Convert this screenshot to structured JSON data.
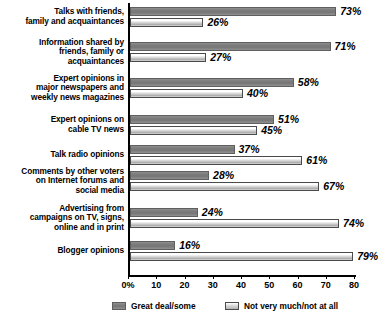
{
  "chart_data": {
    "type": "bar",
    "orientation": "horizontal",
    "title": "",
    "xlabel": "",
    "ylabel": "",
    "xlim": [
      0,
      80
    ],
    "grid": false,
    "legend_position": "bottom",
    "tick_labels": [
      "0%",
      "10",
      "20",
      "30",
      "40",
      "50",
      "60",
      "70",
      "80"
    ],
    "tick_values": [
      0,
      10,
      20,
      30,
      40,
      50,
      60,
      70,
      80
    ],
    "categories": [
      "Talks with friends, family and acquaintances",
      "Information shared by friends, family or acquaintances",
      "Expert opinions in major newspapers and weekly news magazines",
      "Expert opinions on cable TV news",
      "Talk radio opinions",
      "Comments by other voters on Internet forums and social media",
      "Advertising from campaigns on TV, signs, online and in print",
      "Blogger opinions"
    ],
    "category_lines": [
      [
        "Talks with friends,",
        "family and acquaintances"
      ],
      [
        "Information shared by",
        "friends, family or",
        "acquaintances"
      ],
      [
        "Expert opinions in",
        "major newspapers and",
        "weekly news magazines"
      ],
      [
        "Expert opinions on",
        "cable TV news"
      ],
      [
        "Talk radio opinions"
      ],
      [
        "Comments by other voters",
        "on Internet forums and",
        "social media"
      ],
      [
        "Advertising from",
        "campaigns on TV, signs,",
        "online and in print"
      ],
      [
        "Blogger opinions"
      ]
    ],
    "series": [
      {
        "name": "Great deal/some",
        "color": "#7c7c7c",
        "values": [
          73,
          71,
          58,
          51,
          37,
          28,
          24,
          16
        ],
        "labels": [
          "73%",
          "71%",
          "58%",
          "51%",
          "37%",
          "28%",
          "24%",
          "16%"
        ]
      },
      {
        "name": "Not very much/not at all",
        "color": "#ffffff",
        "values": [
          26,
          27,
          40,
          45,
          61,
          67,
          74,
          79
        ],
        "labels": [
          "26%",
          "27%",
          "40%",
          "45%",
          "61%",
          "67%",
          "74%",
          "79%"
        ]
      }
    ]
  },
  "legend": {
    "items": [
      {
        "label": "Great deal/some",
        "swatch": "dark"
      },
      {
        "label": "Not very much/not at all",
        "swatch": "light"
      }
    ]
  }
}
